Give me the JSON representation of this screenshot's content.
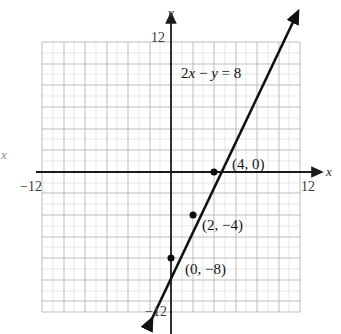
{
  "figure": {
    "caption_equation": "2x − y = 8",
    "equation_parts": {
      "coef": "2",
      "var_x": "x",
      "minus": "−",
      "var_y": "y",
      "equals": "=",
      "rhs": "8"
    },
    "axis_labels": {
      "x_right": "x",
      "x_left": "x",
      "y_top": "y"
    },
    "ticks": {
      "x_min": "−12",
      "x_max": "12",
      "y_max": "12",
      "y_min": "−12"
    },
    "point_labels": [
      {
        "text": "(4, 0)"
      },
      {
        "text": "(2, −4)"
      },
      {
        "text": "(0, −8)"
      }
    ],
    "colors": {
      "line": "#111111",
      "axis": "#1a1a1a",
      "grid_major": "#b9b9bd",
      "grid_minor": "#dcdce0",
      "background": "#ffffff",
      "text": "#141414"
    }
  },
  "chart_data": {
    "type": "line",
    "title": "2x − y = 8",
    "xlabel": "x",
    "ylabel": "y",
    "xlim": [
      -12,
      12
    ],
    "ylim": [
      -12,
      12
    ],
    "xticks": [
      -12,
      12
    ],
    "yticks": [
      -12,
      12
    ],
    "grid": true,
    "grid_step_major": 2,
    "grid_step_minor": 1,
    "legend": "none",
    "series": [
      {
        "name": "2x - y = 8",
        "equation": "y = 2x - 8",
        "slope": 2,
        "intercept": -8,
        "x": [
          -2,
          11.6
        ],
        "y": [
          -12,
          15.2
        ],
        "arrows": "both"
      }
    ],
    "points": [
      {
        "x": 4,
        "y": 0,
        "label": "(4, 0)"
      },
      {
        "x": 2,
        "y": -4,
        "label": "(2, −4)"
      },
      {
        "x": 0,
        "y": -8,
        "label": "(0, −8)"
      }
    ],
    "annotations": [
      {
        "text": "2x − y = 8",
        "x": 1.6,
        "y": 9.3
      }
    ]
  }
}
